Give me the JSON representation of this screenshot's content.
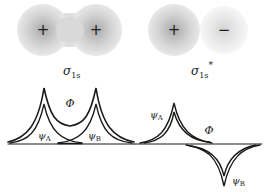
{
  "orbitals": [
    {
      "name": "sigma_1s",
      "label_main": "σ",
      "label_sub": "1s",
      "label_sup": "",
      "type": "bonding",
      "nuclei": [
        {
          "sign": "+",
          "cx": 43,
          "cy": 30
        },
        {
          "sign": "+",
          "cx": 96,
          "cy": 30
        }
      ]
    },
    {
      "name": "sigma_1s_star",
      "label_main": "σ",
      "label_sub": "1s",
      "label_sup": "*",
      "type": "antibonding",
      "nuclei": [
        {
          "sign": "+",
          "cx": 174,
          "cy": 30
        },
        {
          "sign": "−",
          "cx": 224,
          "cy": 30
        }
      ]
    }
  ],
  "wave_plots": [
    {
      "name": "bonding-wavefunction",
      "curve_labels": {
        "combined": "Φ",
        "atom_a": "ψ",
        "atom_a_sub": "A",
        "atom_b": "ψ",
        "atom_b_sub": "B"
      }
    },
    {
      "name": "antibonding-wavefunction",
      "curve_labels": {
        "combined": "Φ",
        "atom_a": "ψ",
        "atom_a_sub": "A",
        "atom_b": "ψ",
        "atom_b_sub": "B"
      }
    }
  ],
  "colors": {
    "line": "#1a1a1a",
    "cloud_outer": "#e2e2e2",
    "cloud_mid": "#d0d0d0",
    "cloud_inner": "#bdbdbd",
    "cloud_faint": "#f0f0f0",
    "cloud_faint_mid": "#e6e6e6"
  }
}
